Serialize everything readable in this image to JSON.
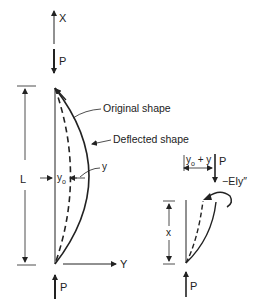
{
  "diagram": {
    "type": "column-buckling",
    "colors": {
      "ink": "#222222",
      "background": "#ffffff"
    },
    "main_figure": {
      "axis_x_label": "X",
      "axis_y_label": "Y",
      "top_load_label": "P",
      "bottom_load_label": "P",
      "length_label": "L",
      "initial_offset_label": "y",
      "initial_offset_subscript": "o",
      "deflection_label": "y",
      "callouts": {
        "original_shape": "Original shape",
        "deflected_shape": "Deflected shape"
      }
    },
    "free_body": {
      "offset_label_y": "y",
      "offset_label_sub": "o",
      "offset_label_rest": " + y",
      "load_label": "P",
      "moment_label": "−EIy″",
      "height_label": "x",
      "bottom_load_label": "P"
    }
  }
}
